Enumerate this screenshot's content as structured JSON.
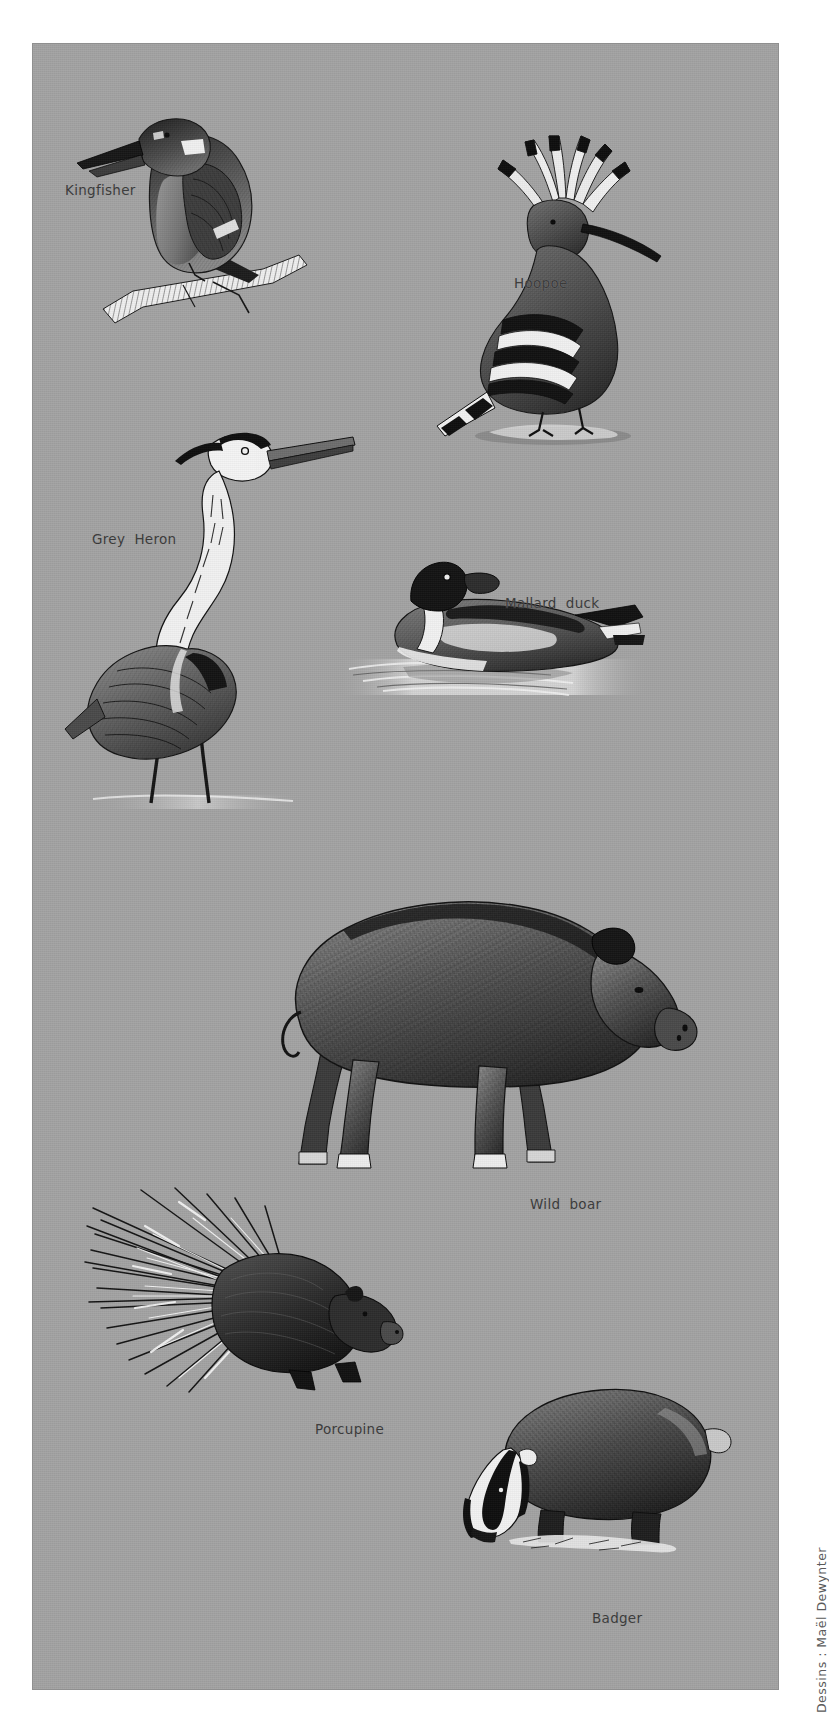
{
  "page": {
    "background_color": "#ffffff",
    "plate_color": "#a3a3a3",
    "ink_color": "#141414",
    "caption_color": "#3a3a3a",
    "width": 835,
    "height": 1733
  },
  "credit": {
    "text": "Dessins : Maël Dewynter"
  },
  "figures": [
    {
      "id": "kingfisher",
      "label": "Kingfisher",
      "kind": "bird",
      "caption_x": 65,
      "caption_y": 165,
      "art_x": 60,
      "art_y": 60
    },
    {
      "id": "hoopoe",
      "label": "Hoopoe",
      "kind": "bird",
      "caption_x": 458,
      "caption_y": 211,
      "art_x": 400,
      "art_y": 110
    },
    {
      "id": "grey-heron",
      "label": "Grey  Heron",
      "kind": "bird",
      "caption_x": 92,
      "caption_y": 482,
      "art_x": 55,
      "art_y": 405
    },
    {
      "id": "mallard-duck",
      "label": "Mallard  duck",
      "kind": "bird",
      "caption_x": 505,
      "caption_y": 550,
      "art_x": 340,
      "art_y": 555
    },
    {
      "id": "wild-boar",
      "label": "Wild  boar",
      "kind": "mammal",
      "caption_x": 530,
      "caption_y": 1080,
      "art_x": 200,
      "art_y": 840
    },
    {
      "id": "porcupine",
      "label": "Porcupine",
      "kind": "mammal",
      "caption_x": 313,
      "caption_y": 1385,
      "art_x": 80,
      "art_y": 1190
    },
    {
      "id": "badger",
      "label": "Badger",
      "kind": "mammal",
      "caption_x": 592,
      "caption_y": 1490,
      "art_x": 400,
      "art_y": 1330
    }
  ]
}
